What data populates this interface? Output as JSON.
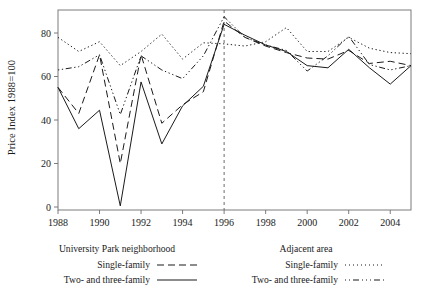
{
  "chart_data": {
    "type": "line",
    "title": "",
    "xlabel": "",
    "ylabel": "Price Index 1988=100",
    "xlim": [
      1988,
      2005
    ],
    "ylim": [
      0,
      90
    ],
    "xticks": [
      1988,
      1990,
      1992,
      1994,
      1996,
      1998,
      2000,
      2002,
      2004
    ],
    "yticks": [
      0,
      20,
      40,
      60,
      80
    ],
    "grid": false,
    "legend_position": "below-plot",
    "annotations": [
      {
        "type": "vertical-line",
        "x": 1996,
        "style": "dashed",
        "label": ""
      }
    ],
    "x": [
      1988,
      1989,
      1990,
      1991,
      1992,
      1993,
      1994,
      1995,
      1996,
      1997,
      1998,
      1999,
      2000,
      2001,
      2002,
      2003,
      2004,
      2005
    ],
    "series": [
      {
        "name": "University Park neighborhood - Single-family",
        "group": "University Park neighborhood",
        "type": "Single-family",
        "style": "dashed",
        "values": [
          55,
          43,
          70,
          20,
          70,
          38.5,
          47,
          53,
          85.5,
          78,
          74,
          71,
          68.5,
          68,
          72,
          66,
          67,
          65
        ]
      },
      {
        "name": "University Park neighborhood - Two- and three-family",
        "group": "University Park neighborhood",
        "type": "Two- and three-family",
        "style": "solid",
        "values": [
          55,
          36,
          44.5,
          0.5,
          57.5,
          29,
          46.5,
          55.5,
          84,
          79,
          74.5,
          71.5,
          65,
          64,
          72.5,
          64,
          56.5,
          65
        ]
      },
      {
        "name": "Adjacent area - Single-family",
        "group": "Adjacent area",
        "type": "Single-family",
        "style": "dotted",
        "values": [
          78,
          71.5,
          76,
          65,
          71.5,
          79.5,
          68,
          75.5,
          75,
          74,
          76,
          82.5,
          71.5,
          71.5,
          78,
          73,
          71,
          70.5
        ]
      },
      {
        "name": "Adjacent area - Two- and three-family",
        "group": "Adjacent area",
        "type": "Two- and three-family",
        "style": "dash-dot",
        "values": [
          63,
          64.5,
          70,
          42.5,
          69.5,
          63,
          59,
          69.5,
          87.5,
          78,
          74.5,
          72,
          62.5,
          69.5,
          78.5,
          65.5,
          63,
          65
        ]
      }
    ]
  },
  "axis": {
    "y_title": "Price Index 1988=100",
    "y_tick_labels": [
      "0",
      "20",
      "40",
      "60",
      "80"
    ],
    "x_tick_labels": [
      "1988",
      "1990",
      "1992",
      "1994",
      "1996",
      "1998",
      "2000",
      "2002",
      "2004"
    ]
  },
  "legend": {
    "left": {
      "heading": "University Park neighborhood",
      "rows": [
        {
          "label": "Single-family",
          "key": "dashed-line-key"
        },
        {
          "label": "Two- and three-family",
          "key": "solid-line-key"
        }
      ]
    },
    "right": {
      "heading": "Adjacent area",
      "rows": [
        {
          "label": "Single-family",
          "key": "dotted-line-key"
        },
        {
          "label": "Two- and three-family",
          "key": "dash-dot-line-key"
        }
      ]
    }
  },
  "colors": {
    "ink": "#1a1a1a",
    "background": "#ffffff"
  }
}
